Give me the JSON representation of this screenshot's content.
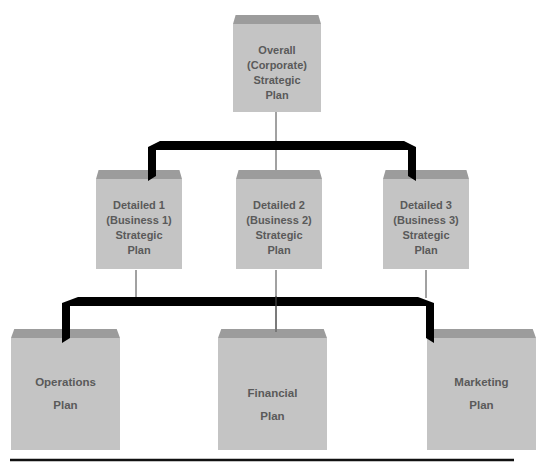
{
  "diagram": {
    "levels": [
      {
        "level": "corporate",
        "nodes": [
          {
            "id": "overall",
            "lines": [
              "Overall",
              "(Corporate)",
              "Strategic",
              "Plan"
            ]
          }
        ]
      },
      {
        "level": "business",
        "nodes": [
          {
            "id": "detailed-1",
            "lines": [
              "Detailed 1",
              "(Business 1)",
              "Strategic",
              "Plan"
            ]
          },
          {
            "id": "detailed-2",
            "lines": [
              "Detailed 2",
              "(Business 2)",
              "Strategic",
              "Plan"
            ]
          },
          {
            "id": "detailed-3",
            "lines": [
              "Detailed 3",
              "(Business 3)",
              "Strategic",
              "Plan"
            ]
          }
        ]
      },
      {
        "level": "functional",
        "nodes": [
          {
            "id": "operations",
            "lines": [
              "Operations",
              "Plan"
            ]
          },
          {
            "id": "financial",
            "lines": [
              "Financial",
              "Plan"
            ]
          },
          {
            "id": "marketing",
            "lines": [
              "Marketing",
              "Plan"
            ]
          }
        ]
      }
    ],
    "connections": [
      {
        "from": "overall",
        "to": [
          "detailed-1",
          "detailed-2",
          "detailed-3"
        ]
      },
      {
        "from": "detailed-1",
        "to": [
          "operations"
        ]
      },
      {
        "from": "detailed-2",
        "to": [
          "financial"
        ]
      },
      {
        "from": "detailed-3",
        "to": [
          "marketing"
        ]
      }
    ],
    "colors": {
      "box": "#c4c4c4",
      "box_top": "#9c9c9c",
      "text": "#5a5a5a",
      "connector": "#000000"
    }
  }
}
